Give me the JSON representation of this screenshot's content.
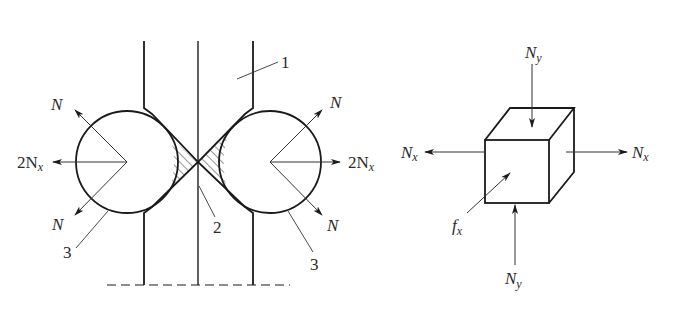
{
  "diagram": {
    "left_figure": {
      "description": "Two rollers pressing strip between dies",
      "labels": {
        "callout_1": "1",
        "callout_2": "2",
        "callout_3_left": "3",
        "callout_3_right": "3",
        "force_left_upper": "N",
        "force_left_lower": "N",
        "force_left_horizontal": "2N",
        "force_left_horizontal_sub": "x",
        "force_right_upper": "N",
        "force_right_lower": "N",
        "force_right_horizontal": "2N",
        "force_right_horizontal_sub": "x"
      }
    },
    "right_figure": {
      "description": "Stress element cube",
      "labels": {
        "top_force": "N",
        "top_force_sub": "y",
        "bottom_force": "N",
        "bottom_force_sub": "y",
        "left_force": "N",
        "left_force_sub": "x",
        "right_force": "N",
        "right_force_sub": "x",
        "friction": "f",
        "friction_sub": "x"
      }
    },
    "colors": {
      "line": "#1a1a1a",
      "thin_line": "#333333",
      "background": "#ffffff"
    }
  }
}
